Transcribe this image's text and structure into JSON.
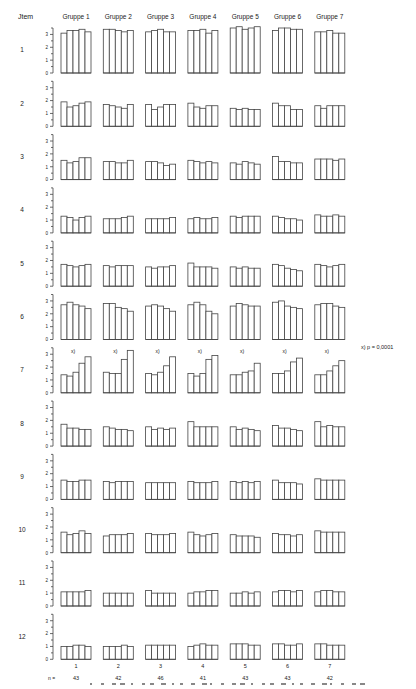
{
  "chart_data": {
    "type": "bar",
    "title": "",
    "row_header": "Jtem",
    "groups": [
      "Gruppe 1",
      "Gruppe 2",
      "Gruppe 3",
      "Gruppe 4",
      "Gruppe 5",
      "Gruppe 6",
      "Gruppe 7"
    ],
    "bottom_group_labels": [
      "1",
      "2",
      "3",
      "4",
      "5",
      "6",
      "7"
    ],
    "n_label": "n =",
    "n_values": [
      "43",
      "42",
      "46",
      "41",
      "43",
      "43",
      "42"
    ],
    "ylim": [
      0,
      3.5
    ],
    "yticks": [
      "0",
      "1",
      "2",
      "3"
    ],
    "significance_marker": "x)",
    "significance_note": "x) p = 0,0001",
    "significant_items": [
      "7"
    ],
    "bars_per_group": 5,
    "items": [
      {
        "label": "1",
        "values": [
          [
            3.1,
            3.3,
            3.3,
            3.4,
            3.2
          ],
          [
            3.4,
            3.4,
            3.3,
            3.2,
            3.3
          ],
          [
            3.2,
            3.3,
            3.4,
            3.2,
            3.2
          ],
          [
            3.3,
            3.3,
            3.4,
            3.1,
            3.3
          ],
          [
            3.5,
            3.6,
            3.4,
            3.5,
            3.6
          ],
          [
            3.3,
            3.5,
            3.5,
            3.4,
            3.4
          ],
          [
            3.2,
            3.2,
            3.3,
            3.1,
            3.1
          ]
        ]
      },
      {
        "label": "2",
        "values": [
          [
            1.9,
            1.5,
            1.6,
            1.8,
            1.9
          ],
          [
            1.7,
            1.6,
            1.5,
            1.4,
            1.7
          ],
          [
            1.7,
            1.3,
            1.5,
            1.7,
            1.7
          ],
          [
            1.8,
            1.5,
            1.4,
            1.6,
            1.6
          ],
          [
            1.4,
            1.3,
            1.4,
            1.3,
            1.3
          ],
          [
            1.8,
            1.6,
            1.6,
            1.3,
            1.3
          ],
          [
            1.6,
            1.4,
            1.6,
            1.6,
            1.6
          ]
        ]
      },
      {
        "label": "3",
        "values": [
          [
            1.5,
            1.3,
            1.4,
            1.7,
            1.7
          ],
          [
            1.4,
            1.4,
            1.3,
            1.3,
            1.5
          ],
          [
            1.4,
            1.4,
            1.3,
            1.1,
            1.2
          ],
          [
            1.5,
            1.4,
            1.3,
            1.4,
            1.3
          ],
          [
            1.3,
            1.2,
            1.4,
            1.3,
            1.2
          ],
          [
            1.8,
            1.4,
            1.4,
            1.3,
            1.3
          ],
          [
            1.6,
            1.6,
            1.6,
            1.5,
            1.6
          ]
        ]
      },
      {
        "label": "4",
        "values": [
          [
            1.3,
            1.2,
            1.0,
            1.2,
            1.3
          ],
          [
            1.1,
            1.1,
            1.1,
            1.2,
            1.3
          ],
          [
            1.1,
            1.1,
            1.1,
            1.1,
            1.2
          ],
          [
            1.1,
            1.2,
            1.1,
            1.1,
            1.2
          ],
          [
            1.3,
            1.2,
            1.3,
            1.3,
            1.3
          ],
          [
            1.3,
            1.2,
            1.1,
            1.1,
            1.0
          ],
          [
            1.4,
            1.3,
            1.3,
            1.4,
            1.3
          ]
        ]
      },
      {
        "label": "5",
        "values": [
          [
            1.7,
            1.6,
            1.5,
            1.6,
            1.7
          ],
          [
            1.6,
            1.5,
            1.6,
            1.6,
            1.6
          ],
          [
            1.5,
            1.4,
            1.5,
            1.5,
            1.6
          ],
          [
            1.8,
            1.5,
            1.5,
            1.5,
            1.4
          ],
          [
            1.5,
            1.4,
            1.5,
            1.4,
            1.4
          ],
          [
            1.7,
            1.6,
            1.4,
            1.3,
            1.2
          ],
          [
            1.7,
            1.6,
            1.5,
            1.6,
            1.7
          ]
        ]
      },
      {
        "label": "6",
        "values": [
          [
            2.7,
            2.9,
            2.7,
            2.6,
            2.4
          ],
          [
            2.8,
            2.8,
            2.5,
            2.4,
            2.2
          ],
          [
            2.6,
            2.7,
            2.6,
            2.4,
            2.2
          ],
          [
            2.7,
            2.9,
            2.7,
            2.2,
            2.0
          ],
          [
            2.6,
            2.8,
            2.7,
            2.6,
            2.6
          ],
          [
            2.9,
            3.0,
            2.6,
            2.5,
            2.4
          ],
          [
            2.7,
            2.8,
            2.8,
            2.6,
            2.5
          ]
        ]
      },
      {
        "label": "7",
        "values": [
          [
            1.4,
            1.3,
            1.6,
            2.3,
            2.8
          ],
          [
            1.6,
            1.5,
            1.5,
            2.6,
            3.3
          ],
          [
            1.5,
            1.4,
            1.6,
            2.1,
            2.8
          ],
          [
            1.5,
            1.3,
            1.5,
            2.6,
            2.9
          ],
          [
            1.4,
            1.4,
            1.6,
            1.7,
            2.3
          ],
          [
            1.5,
            1.5,
            1.7,
            2.4,
            2.7
          ],
          [
            1.4,
            1.4,
            1.7,
            2.1,
            2.5
          ]
        ]
      },
      {
        "label": "8",
        "values": [
          [
            1.7,
            1.4,
            1.4,
            1.3,
            1.3
          ],
          [
            1.5,
            1.4,
            1.3,
            1.3,
            1.2
          ],
          [
            1.5,
            1.3,
            1.4,
            1.3,
            1.4
          ],
          [
            1.9,
            1.5,
            1.5,
            1.5,
            1.5
          ],
          [
            1.5,
            1.3,
            1.4,
            1.3,
            1.2
          ],
          [
            1.6,
            1.4,
            1.4,
            1.3,
            1.2
          ],
          [
            1.9,
            1.5,
            1.6,
            1.5,
            1.5
          ]
        ]
      },
      {
        "label": "9",
        "values": [
          [
            1.5,
            1.4,
            1.4,
            1.5,
            1.5
          ],
          [
            1.4,
            1.3,
            1.4,
            1.4,
            1.4
          ],
          [
            1.3,
            1.3,
            1.3,
            1.3,
            1.3
          ],
          [
            1.4,
            1.3,
            1.3,
            1.3,
            1.4
          ],
          [
            1.4,
            1.3,
            1.4,
            1.3,
            1.4
          ],
          [
            1.5,
            1.3,
            1.3,
            1.3,
            1.2
          ],
          [
            1.6,
            1.5,
            1.5,
            1.5,
            1.5
          ]
        ]
      },
      {
        "label": "10",
        "values": [
          [
            1.6,
            1.4,
            1.5,
            1.7,
            1.5
          ],
          [
            1.3,
            1.4,
            1.4,
            1.4,
            1.5
          ],
          [
            1.5,
            1.4,
            1.4,
            1.4,
            1.5
          ],
          [
            1.6,
            1.4,
            1.3,
            1.4,
            1.5
          ],
          [
            1.4,
            1.3,
            1.3,
            1.3,
            1.2
          ],
          [
            1.5,
            1.4,
            1.4,
            1.3,
            1.4
          ],
          [
            1.7,
            1.6,
            1.6,
            1.6,
            1.6
          ]
        ]
      },
      {
        "label": "11",
        "values": [
          [
            1.1,
            1.1,
            1.1,
            1.1,
            1.2
          ],
          [
            1.0,
            1.0,
            1.0,
            1.0,
            1.0
          ],
          [
            1.2,
            1.0,
            1.0,
            1.0,
            1.0
          ],
          [
            1.0,
            1.1,
            1.1,
            1.2,
            1.2
          ],
          [
            1.0,
            1.0,
            1.1,
            1.0,
            1.1
          ],
          [
            1.1,
            1.2,
            1.2,
            1.1,
            1.2
          ],
          [
            1.1,
            1.2,
            1.2,
            1.1,
            1.1
          ]
        ]
      },
      {
        "label": "12",
        "values": [
          [
            1.0,
            1.0,
            1.1,
            1.1,
            1.0
          ],
          [
            1.0,
            1.0,
            1.0,
            1.1,
            1.0
          ],
          [
            1.1,
            1.1,
            1.1,
            1.1,
            1.1
          ],
          [
            1.0,
            1.1,
            1.2,
            1.1,
            1.1
          ],
          [
            1.2,
            1.2,
            1.2,
            1.1,
            1.1
          ],
          [
            1.2,
            1.2,
            1.1,
            1.1,
            1.2
          ],
          [
            1.2,
            1.2,
            1.1,
            1.1,
            1.1
          ]
        ]
      }
    ]
  }
}
